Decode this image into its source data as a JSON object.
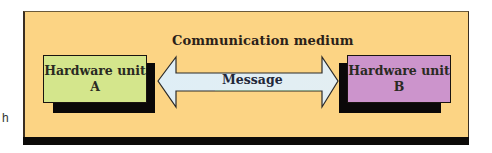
{
  "stray_text": "h",
  "diagram": {
    "medium_label": "Communication medium",
    "message_label": "Message",
    "unit_a": {
      "line1": "Hardware unit",
      "line2": "A"
    },
    "unit_b": {
      "line1": "Hardware unit",
      "line2": "B"
    }
  },
  "colors": {
    "panel_bg": "#fcd484",
    "unit_a_bg": "#d4e68c",
    "unit_b_bg": "#cc94cc",
    "arrow_fill": "#dceaf0",
    "shadow": "#0a0808"
  }
}
